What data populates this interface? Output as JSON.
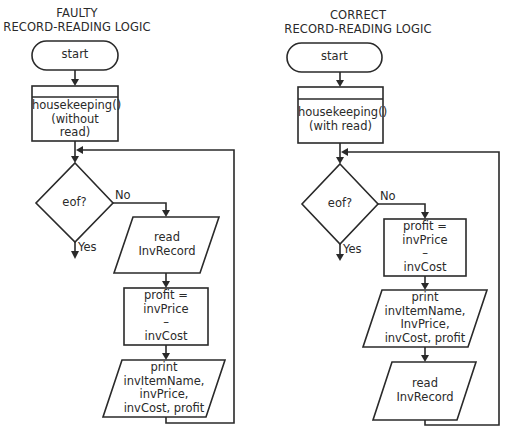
{
  "diagram": {
    "type": "flowchart-comparison",
    "left": {
      "title_line1": "FAULTY",
      "title_line2": "RECORD-READING LOGIC",
      "nodes": [
        {
          "id": "start",
          "shape": "terminator",
          "text": "start"
        },
        {
          "id": "housekeeping",
          "shape": "predefined-process",
          "lines": [
            "housekeeping()",
            "(without",
            "read)"
          ]
        },
        {
          "id": "eof",
          "shape": "decision",
          "text": "eof?"
        },
        {
          "id": "read",
          "shape": "input-output",
          "lines": [
            "read",
            "InvRecord"
          ]
        },
        {
          "id": "profit",
          "shape": "process",
          "lines": [
            "profit =",
            "invPrice",
            "–",
            "invCost"
          ]
        },
        {
          "id": "print",
          "shape": "input-output",
          "lines": [
            "print",
            "invItemName,",
            "invPrice,",
            "invCost, profit"
          ]
        }
      ],
      "branch_labels": {
        "no": "No",
        "yes": "Yes"
      },
      "edges": [
        {
          "from": "start",
          "to": "housekeeping"
        },
        {
          "from": "housekeeping",
          "to": "eof"
        },
        {
          "from": "eof",
          "to": "read",
          "label": "No"
        },
        {
          "from": "eof",
          "to": "end",
          "label": "Yes"
        },
        {
          "from": "read",
          "to": "profit"
        },
        {
          "from": "profit",
          "to": "print"
        },
        {
          "from": "print",
          "to": "eof",
          "type": "loop-back"
        }
      ]
    },
    "right": {
      "title_line1": "CORRECT",
      "title_line2": "RECORD-READING LOGIC",
      "nodes": [
        {
          "id": "start",
          "shape": "terminator",
          "text": "start"
        },
        {
          "id": "housekeeping",
          "shape": "predefined-process",
          "lines": [
            "housekeeping()",
            "(with read)"
          ]
        },
        {
          "id": "eof",
          "shape": "decision",
          "text": "eof?"
        },
        {
          "id": "profit",
          "shape": "process",
          "lines": [
            "profit =",
            "invPrice",
            "–",
            "invCost"
          ]
        },
        {
          "id": "print",
          "shape": "input-output",
          "lines": [
            "print",
            "invItemName,",
            "InvPrice,",
            "invCost, profit"
          ]
        },
        {
          "id": "read",
          "shape": "input-output",
          "lines": [
            "read",
            "InvRecord"
          ]
        }
      ],
      "branch_labels": {
        "no": "No",
        "yes": "Yes"
      },
      "edges": [
        {
          "from": "start",
          "to": "housekeeping"
        },
        {
          "from": "housekeeping",
          "to": "eof"
        },
        {
          "from": "eof",
          "to": "profit",
          "label": "No"
        },
        {
          "from": "eof",
          "to": "end",
          "label": "Yes"
        },
        {
          "from": "profit",
          "to": "print"
        },
        {
          "from": "print",
          "to": "read"
        },
        {
          "from": "read",
          "to": "eof",
          "type": "loop-back"
        }
      ]
    },
    "colors": {
      "stroke": "#2a2a2a",
      "background": "#ffffff"
    }
  }
}
